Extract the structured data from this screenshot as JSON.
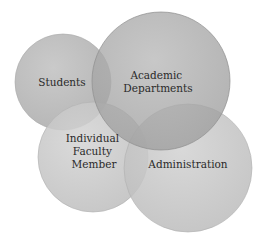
{
  "diagram": {
    "type": "venn",
    "circles": [
      {
        "id": "students",
        "lines": [
          "Students"
        ],
        "fill": "#b9b9b9"
      },
      {
        "id": "individual-faculty-member",
        "lines": [
          "Individual",
          "Faculty",
          "Member"
        ],
        "fill": "#c8c8c8"
      },
      {
        "id": "administration",
        "lines": [
          "Administration"
        ],
        "fill": "#c6c6c6"
      },
      {
        "id": "academic-departments",
        "lines": [
          "Academic",
          "Departments"
        ],
        "fill": "#a9a9a9"
      }
    ]
  }
}
